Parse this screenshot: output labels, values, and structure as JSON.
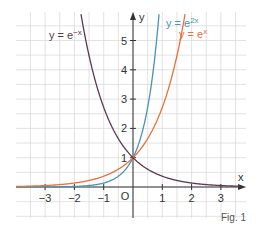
{
  "chart_data": {
    "type": "line",
    "title": "",
    "xlabel": "x",
    "ylabel": "y",
    "xlim": [
      -4,
      3.8
    ],
    "ylim": [
      -0.8,
      5.8
    ],
    "grid": true,
    "grid_step": 0.5,
    "origin_label": "O",
    "x_ticks": [
      -3,
      -2,
      -1,
      1,
      2,
      3
    ],
    "y_ticks": [
      1,
      2,
      3,
      4,
      5
    ],
    "series": [
      {
        "name": "y = e^2x",
        "label": "y = e",
        "exponent": "2x",
        "color": "#4a93b8",
        "formula": "exp(2x)"
      },
      {
        "name": "y = e^x",
        "label": "y = e",
        "exponent": "x",
        "color": "#e8703a",
        "formula": "exp(x)"
      },
      {
        "name": "y = e^-x",
        "label": "y = e",
        "exponent": "−x",
        "color": "#5a3a4e",
        "formula": "exp(-x)"
      }
    ],
    "annotations": [
      "Fig. 1"
    ],
    "intersection": {
      "x": 0,
      "y": 1
    }
  },
  "caption": "Fig. 1"
}
